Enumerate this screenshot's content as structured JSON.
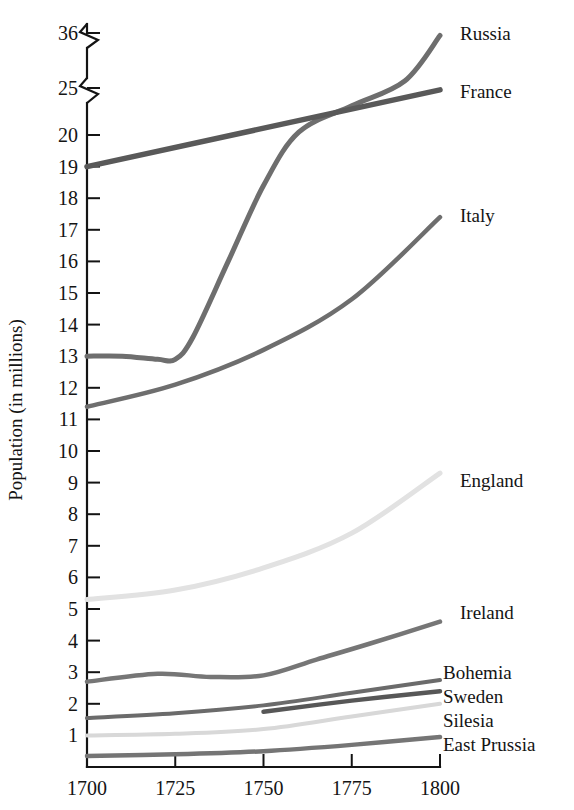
{
  "chart_data": {
    "type": "line",
    "title": "",
    "xlabel": "",
    "ylabel": "Population (in millions)",
    "x": [
      1700,
      1725,
      1750,
      1775,
      1800
    ],
    "xlim": [
      1700,
      1800
    ],
    "xticks": [
      "1700",
      "1725",
      "1750",
      "1775",
      "1800"
    ],
    "yticks": [
      "1",
      "2",
      "3",
      "4",
      "5",
      "6",
      "7",
      "8",
      "9",
      "10",
      "11",
      "12",
      "13",
      "14",
      "15",
      "16",
      "17",
      "18",
      "19",
      "20",
      "25",
      "36"
    ],
    "ylim": [
      0,
      36
    ],
    "axis_breaks": [
      "between 20 and 25",
      "between 25 and 36"
    ],
    "grid": false,
    "legend_position": "right-of-line-ends",
    "series": [
      {
        "name": "Russia",
        "color": "#6e6e6e",
        "label_value_1800": 35.5,
        "points": [
          {
            "x": 1700,
            "y": 13.0
          },
          {
            "x": 1710,
            "y": 13.0
          },
          {
            "x": 1720,
            "y": 12.9
          },
          {
            "x": 1725,
            "y": 12.9
          },
          {
            "x": 1730,
            "y": 13.6
          },
          {
            "x": 1740,
            "y": 16.0
          },
          {
            "x": 1750,
            "y": 18.4
          },
          {
            "x": 1760,
            "y": 20.3
          },
          {
            "x": 1775,
            "y": 23.1
          },
          {
            "x": 1790,
            "y": 26.4
          },
          {
            "x": 1800,
            "y": 35.5
          }
        ]
      },
      {
        "name": "France",
        "color": "#595959",
        "label_value_1800": 24.8,
        "points": [
          {
            "x": 1700,
            "y": 19.0
          },
          {
            "x": 1800,
            "y": 24.8
          }
        ]
      },
      {
        "name": "Italy",
        "color": "#6e6e6e",
        "label_value_1800": 17.4,
        "points": [
          {
            "x": 1700,
            "y": 11.4
          },
          {
            "x": 1725,
            "y": 12.1
          },
          {
            "x": 1750,
            "y": 13.2
          },
          {
            "x": 1775,
            "y": 14.8
          },
          {
            "x": 1800,
            "y": 17.4
          }
        ]
      },
      {
        "name": "England",
        "color": "#e2e2e2",
        "label_value_1800": 9.3,
        "points": [
          {
            "x": 1700,
            "y": 5.3
          },
          {
            "x": 1725,
            "y": 5.6
          },
          {
            "x": 1750,
            "y": 6.3
          },
          {
            "x": 1775,
            "y": 7.4
          },
          {
            "x": 1800,
            "y": 9.3
          }
        ]
      },
      {
        "name": "Ireland",
        "color": "#767676",
        "label_value_1800": 4.6,
        "points": [
          {
            "x": 1700,
            "y": 2.7
          },
          {
            "x": 1720,
            "y": 2.95
          },
          {
            "x": 1735,
            "y": 2.85
          },
          {
            "x": 1750,
            "y": 2.9
          },
          {
            "x": 1765,
            "y": 3.4
          },
          {
            "x": 1780,
            "y": 3.9
          },
          {
            "x": 1800,
            "y": 4.6
          }
        ]
      },
      {
        "name": "Bohemia",
        "color": "#6b6b6b",
        "label_value_1800": 2.75,
        "points": [
          {
            "x": 1700,
            "y": 1.55
          },
          {
            "x": 1725,
            "y": 1.7
          },
          {
            "x": 1750,
            "y": 1.95
          },
          {
            "x": 1775,
            "y": 2.35
          },
          {
            "x": 1800,
            "y": 2.75
          }
        ]
      },
      {
        "name": "Sweden",
        "color": "#575757",
        "label_value_1800": 2.4,
        "points": [
          {
            "x": 1750,
            "y": 1.75
          },
          {
            "x": 1775,
            "y": 2.1
          },
          {
            "x": 1800,
            "y": 2.4
          }
        ]
      },
      {
        "name": "Silesia",
        "color": "#d8d8d8",
        "label_value_1800": 2.0,
        "points": [
          {
            "x": 1700,
            "y": 1.0
          },
          {
            "x": 1725,
            "y": 1.05
          },
          {
            "x": 1750,
            "y": 1.2
          },
          {
            "x": 1775,
            "y": 1.6
          },
          {
            "x": 1800,
            "y": 2.0
          }
        ]
      },
      {
        "name": "East Prussia",
        "color": "#757575",
        "label_value_1800": 0.95,
        "points": [
          {
            "x": 1700,
            "y": 0.35
          },
          {
            "x": 1725,
            "y": 0.4
          },
          {
            "x": 1750,
            "y": 0.5
          },
          {
            "x": 1775,
            "y": 0.7
          },
          {
            "x": 1800,
            "y": 0.95
          }
        ]
      }
    ],
    "series_labels": [
      {
        "name": "Russia",
        "x": 460,
        "y": 40
      },
      {
        "name": "France",
        "x": 460,
        "y": 98
      },
      {
        "name": "Italy",
        "x": 460,
        "y": 222
      },
      {
        "name": "England",
        "x": 460,
        "y": 487
      },
      {
        "name": "Ireland",
        "x": 460,
        "y": 619
      },
      {
        "name": "Bohemia",
        "x": 443,
        "y": 679
      },
      {
        "name": "Sweden",
        "x": 443,
        "y": 703
      },
      {
        "name": "Silesia",
        "x": 443,
        "y": 727
      },
      {
        "name": "East Prussia",
        "x": 443,
        "y": 751
      }
    ]
  }
}
